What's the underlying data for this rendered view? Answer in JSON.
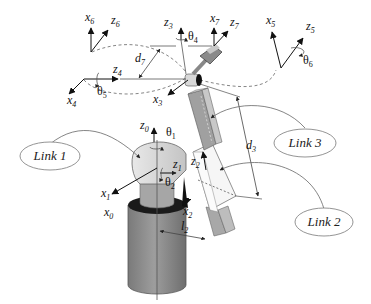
{
  "diagram": {
    "type": "robot-arm-kinematics",
    "links": [
      {
        "id": "link1",
        "label": "Link 1"
      },
      {
        "id": "link2",
        "label": "Link 2"
      },
      {
        "id": "link3",
        "label": "Link 3"
      }
    ],
    "frames": {
      "x0": {
        "base": "x",
        "sub": "0"
      },
      "z0": {
        "base": "z",
        "sub": "0"
      },
      "x1": {
        "base": "x",
        "sub": "1"
      },
      "z1": {
        "base": "z",
        "sub": "1"
      },
      "x2": {
        "base": "x",
        "sub": "2"
      },
      "z2": {
        "base": "z",
        "sub": "2"
      },
      "x3": {
        "base": "x",
        "sub": "3"
      },
      "z3": {
        "base": "z",
        "sub": "3"
      },
      "x4": {
        "base": "x",
        "sub": "4"
      },
      "z4": {
        "base": "z",
        "sub": "4"
      },
      "x5": {
        "base": "x",
        "sub": "5"
      },
      "z5": {
        "base": "z",
        "sub": "5"
      },
      "x6": {
        "base": "x",
        "sub": "6"
      },
      "z6": {
        "base": "z",
        "sub": "6"
      },
      "x7": {
        "base": "x",
        "sub": "7"
      },
      "z7": {
        "base": "z",
        "sub": "7"
      }
    },
    "joint_angles": {
      "theta1": {
        "base": "θ",
        "sub": "1"
      },
      "theta2": {
        "base": "θ",
        "sub": "2"
      },
      "theta4": {
        "base": "θ",
        "sub": "4"
      },
      "theta5": {
        "base": "θ",
        "sub": "5"
      },
      "theta6": {
        "base": "θ",
        "sub": "6"
      }
    },
    "dimensions": {
      "d3": {
        "base": "d",
        "sub": "3"
      },
      "d7": {
        "base": "d",
        "sub": "7"
      },
      "l2": {
        "base": "l",
        "sub": "2"
      }
    },
    "colors": {
      "base_cylinder": "#8c8c8c",
      "base_ring": "#1a1a1a",
      "shoulder": "#dcdcdc",
      "link_gray": "#a8a8a8",
      "link_light": "#f4f4f4",
      "background": "#ffffff"
    }
  }
}
